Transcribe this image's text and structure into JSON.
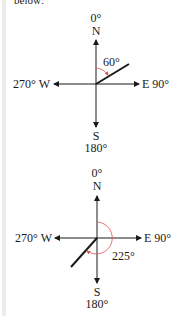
{
  "top_text": "below:",
  "colors": {
    "axis": "#1a1a1a",
    "arc": "#d9534f",
    "background": "#ffffff"
  },
  "diagrams": [
    {
      "north_deg": "0°",
      "north": "N",
      "south": "S",
      "south_deg": "180°",
      "west": "270° W",
      "east": "E 90°",
      "bearing_label": "60°",
      "bearing": 60
    },
    {
      "north_deg": "0°",
      "north": "N",
      "south": "S",
      "south_deg": "180°",
      "west": "270° W",
      "east": "E 90°",
      "bearing_label": "225°",
      "bearing": 225
    }
  ]
}
